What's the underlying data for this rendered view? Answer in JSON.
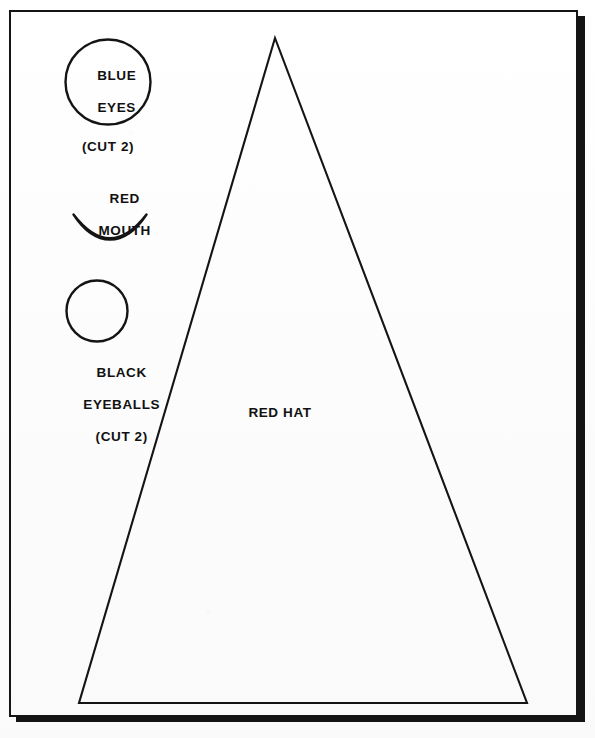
{
  "document": {
    "type": "craft-pattern-template",
    "title": "Santa face pattern pieces",
    "background_color": "#fdfdfd",
    "ink_color": "#141414"
  },
  "frame": {
    "name": "page-border",
    "x": 9,
    "y": 10,
    "width": 569,
    "height": 707,
    "border_width_px": 2,
    "shadow_width_px": 7,
    "shadow_color": "#141414"
  },
  "pieces": [
    {
      "id": "blue-eyes",
      "shape": "circle",
      "label_lines": [
        "BLUE",
        "EYES"
      ],
      "quantity_note": "(CUT 2)",
      "color_word": "BLUE",
      "cx": 107.5,
      "cy": 82,
      "r": 42.5,
      "label_position": "inside"
    },
    {
      "id": "red-mouth",
      "shape": "crescent",
      "label_lines": [
        "RED",
        "MOUTH"
      ],
      "quantity_note": "",
      "color_word": "RED",
      "x": 73,
      "y": 213,
      "width": 76,
      "height": 33,
      "label_position": "above"
    },
    {
      "id": "black-eyeballs",
      "shape": "circle",
      "label_lines": [
        "BLACK",
        "EYEBALLS"
      ],
      "quantity_note": "(CUT 2)",
      "color_word": "BLACK",
      "cx": 96.5,
      "cy": 310.5,
      "r": 30.5,
      "label_position": "below"
    },
    {
      "id": "red-hat",
      "shape": "triangle",
      "label_lines": [
        "RED HAT"
      ],
      "quantity_note": "",
      "color_word": "RED",
      "apex_x": 275,
      "apex_y": 38,
      "base_left_x": 79,
      "base_right_x": 527,
      "base_y": 703,
      "label_position": "inside"
    }
  ],
  "labels": {
    "blue_eyes_line1": "BLUE",
    "blue_eyes_line2": "EYES",
    "blue_eyes_cut": "(CUT 2)",
    "red_mouth_line1": "RED",
    "red_mouth_line2": "MOUTH",
    "black_eyeballs_line1": "BLACK",
    "black_eyeballs_line2": "EYEBALLS",
    "black_eyeballs_cut": "(CUT 2)",
    "red_hat": "RED HAT"
  }
}
